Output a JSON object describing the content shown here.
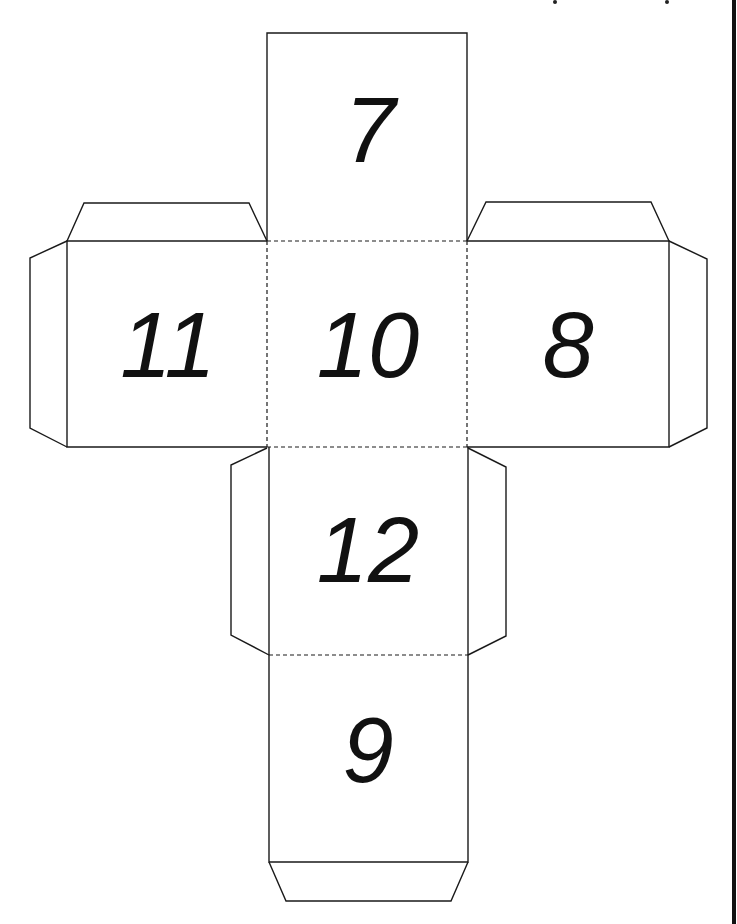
{
  "diagram": {
    "type": "die-net",
    "colors": {
      "line": "#1a1a1a",
      "background": "#ffffff",
      "text": "#111111"
    },
    "faces": [
      {
        "id": "top",
        "label": "7"
      },
      {
        "id": "left",
        "label": "11"
      },
      {
        "id": "center",
        "label": "10"
      },
      {
        "id": "right",
        "label": "8"
      },
      {
        "id": "lower",
        "label": "12"
      },
      {
        "id": "bottom",
        "label": "9"
      }
    ],
    "legend": {
      "solid_line": "cut",
      "dashed_line": "fold"
    }
  }
}
